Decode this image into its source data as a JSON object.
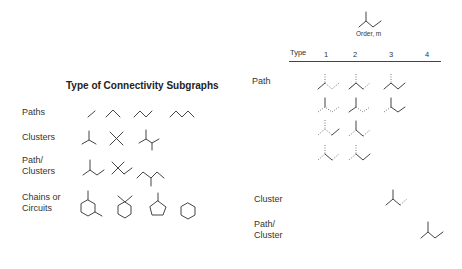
{
  "left_panel": {
    "title": "Type of Connectivity Subgraphs",
    "rows": [
      {
        "label": "Paths"
      },
      {
        "label": "Clusters"
      },
      {
        "label": "Path/\nClusters"
      },
      {
        "label": "Chains or\nCircuits"
      }
    ]
  },
  "right_panel": {
    "axis_label": "Order, m",
    "header": {
      "type_label": "Type",
      "orders": [
        "1",
        "2",
        "3",
        "4"
      ]
    },
    "rows": [
      {
        "label": "Path",
        "counts": {
          "1": 4,
          "2": 4,
          "3": 2,
          "4": 0
        }
      },
      {
        "label": "Cluster",
        "counts": {
          "1": 0,
          "2": 0,
          "3": 1,
          "4": 0
        }
      },
      {
        "label": "Path/\nCluster",
        "counts": {
          "1": 0,
          "2": 0,
          "3": 0,
          "4": 1
        }
      }
    ],
    "molecule": "2-methylbutane skeleton"
  },
  "colors": {
    "line": "#444444",
    "dashed": "#777777",
    "text": "#333333"
  }
}
